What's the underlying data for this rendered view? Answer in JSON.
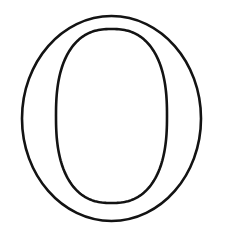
{
  "canvas": {
    "width": 225,
    "height": 236,
    "background_color": "#ffffff"
  },
  "artwork": {
    "kind": "letter-outline",
    "subject": "letter-o",
    "character": "O",
    "case": "uppercase",
    "style": "serif-outline-coloring-page",
    "description": "Outline drawing of the capital letter O",
    "stroke_color": "#131313",
    "stroke_width": 2.6,
    "fill_color": "none",
    "outer_contour": {
      "shape": "ellipse",
      "center_x": 111.5,
      "center_y": 118.5,
      "radius_x": 89.5,
      "radius_y": 102.5,
      "left": 22,
      "right": 201,
      "top": 16,
      "bottom": 221
    },
    "inner_contour": {
      "shape": "superellipse",
      "center_x": 111.5,
      "center_y": 116.0,
      "radius_x": 55.5,
      "radius_y": 87.0,
      "left": 56,
      "right": 167,
      "top": 29,
      "bottom": 203
    },
    "stroke_thickness": {
      "left_wall": 34,
      "right_wall": 35,
      "top_wall": 13,
      "bottom_wall": 18
    }
  }
}
